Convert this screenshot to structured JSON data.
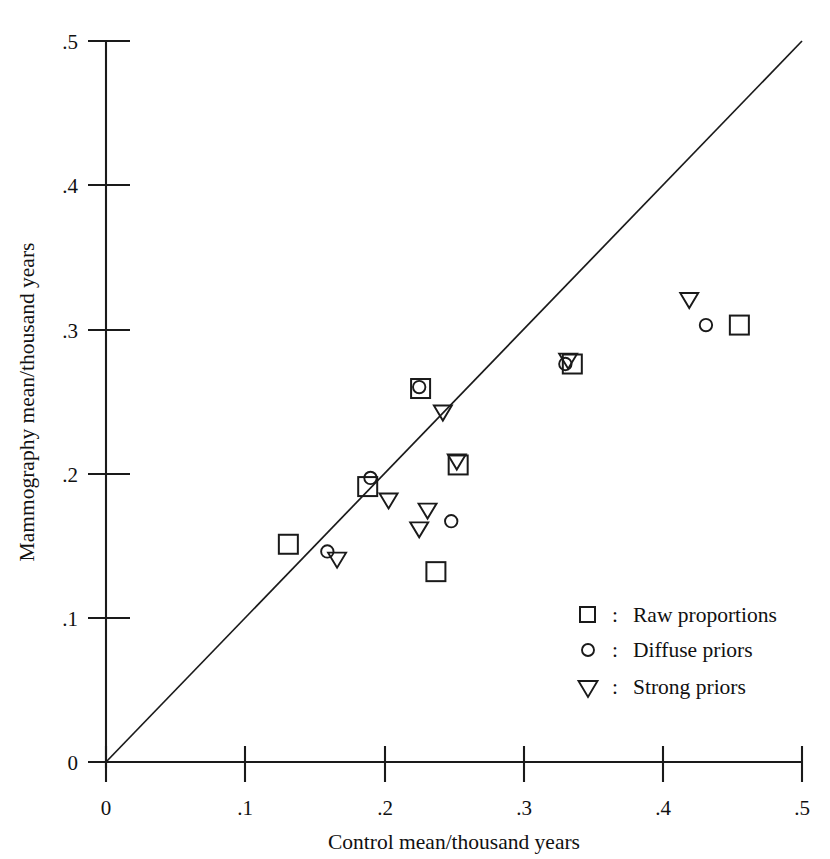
{
  "chart_data": {
    "type": "scatter",
    "title": "",
    "xlabel": "Control mean/thousand years",
    "ylabel": "Mammography mean/thousand years",
    "xlim": [
      0,
      0.5
    ],
    "ylim": [
      0,
      0.5
    ],
    "xticks": [
      "0",
      ".1",
      ".2",
      ".3",
      ".4",
      ".5"
    ],
    "xtick_values": [
      0,
      0.1,
      0.2,
      0.3,
      0.4,
      0.5
    ],
    "yticks": [
      "0",
      ".1",
      ".2",
      ".3",
      ".4",
      ".5"
    ],
    "ytick_values": [
      0,
      0.1,
      0.2,
      0.3,
      0.4,
      0.5
    ],
    "grid": false,
    "reference_line": {
      "label": "y = x",
      "from": [
        0,
        0
      ],
      "to": [
        0.5,
        0.5
      ]
    },
    "legend_position": "lower-right",
    "series": [
      {
        "name": "Raw proportions",
        "marker": "square",
        "points": [
          [
            0.131,
            0.151
          ],
          [
            0.188,
            0.191
          ],
          [
            0.226,
            0.259
          ],
          [
            0.237,
            0.132
          ],
          [
            0.253,
            0.206
          ],
          [
            0.335,
            0.276
          ],
          [
            0.455,
            0.303
          ]
        ]
      },
      {
        "name": "Diffuse priors",
        "marker": "circle",
        "points": [
          [
            0.159,
            0.146
          ],
          [
            0.19,
            0.197
          ],
          [
            0.225,
            0.26
          ],
          [
            0.248,
            0.167
          ],
          [
            0.33,
            0.276
          ],
          [
            0.431,
            0.303
          ]
        ]
      },
      {
        "name": "Strong priors",
        "marker": "triangle-down",
        "points": [
          [
            0.166,
            0.14
          ],
          [
            0.203,
            0.181
          ],
          [
            0.225,
            0.161
          ],
          [
            0.231,
            0.174
          ],
          [
            0.242,
            0.242
          ],
          [
            0.252,
            0.208
          ],
          [
            0.332,
            0.278
          ],
          [
            0.419,
            0.32
          ]
        ]
      }
    ]
  },
  "axes": {
    "x_title": "Control mean/thousand years",
    "y_title": "Mammography mean/thousand years",
    "x_tick_labels": [
      "0",
      ".1",
      ".2",
      ".3",
      ".4",
      ".5"
    ],
    "y_tick_labels": [
      "0",
      ".1",
      ".2",
      ".3",
      ".4",
      ".5"
    ]
  },
  "legend": {
    "separator": ":",
    "entries": [
      {
        "marker": "square",
        "label": "Raw proportions"
      },
      {
        "marker": "circle",
        "label": "Diffuse priors"
      },
      {
        "marker": "triangle-down",
        "label": "Strong priors"
      }
    ]
  }
}
